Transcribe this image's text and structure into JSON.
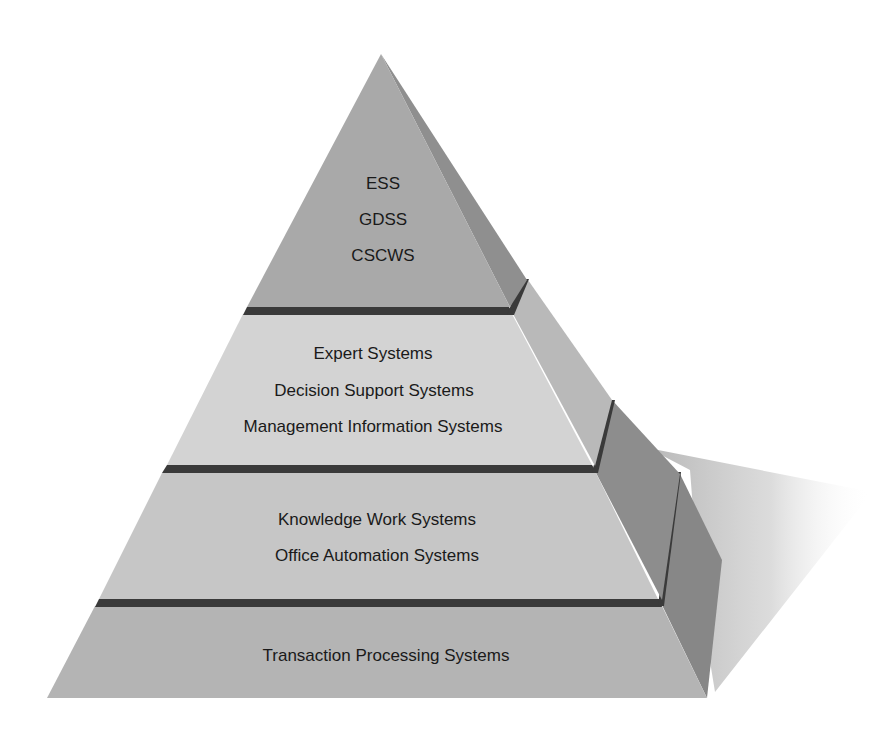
{
  "diagram": {
    "type": "pyramid",
    "colors": {
      "background": "#ffffff",
      "top_front": "#a9a9a9",
      "top_side": "#8f8f8f",
      "middle_front": "#d3d3d3",
      "middle_side": "#b9b9b9",
      "lower_front": "#c6c6c6",
      "lower_side": "#8d8d8d",
      "base_front": "#b4b4b4",
      "base_side": "#878787",
      "divider": "#3a3a3a",
      "shadow": "#c8c8c8",
      "text": "#1a1a1a"
    },
    "tiers": [
      {
        "level": "top",
        "labels": [
          "ESS",
          "GDSS",
          "CSCWS"
        ]
      },
      {
        "level": "middle",
        "labels": [
          "Expert Systems",
          "Decision Support Systems",
          "Management Information Systems"
        ]
      },
      {
        "level": "lower",
        "labels": [
          "Knowledge Work Systems",
          "Office Automation Systems"
        ]
      },
      {
        "level": "base",
        "labels": [
          "Transaction Processing Systems"
        ]
      }
    ]
  }
}
